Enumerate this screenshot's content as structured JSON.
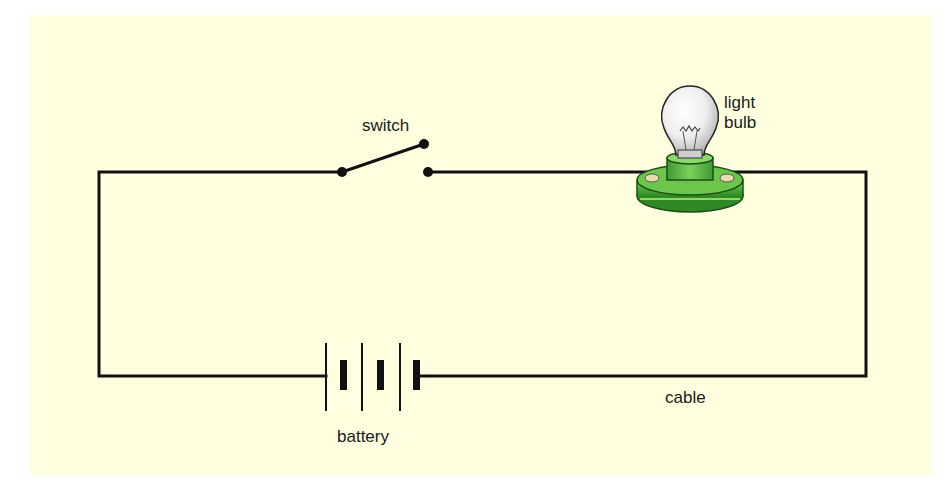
{
  "diagram": {
    "type": "simple electric circuit",
    "background_color": "#ffffe0",
    "wire_color": "#111111",
    "labels": {
      "switch": "switch",
      "light_bulb_line1": "light",
      "light_bulb_line2": "bulb",
      "battery": "battery",
      "cable": "cable"
    },
    "components": [
      {
        "name": "switch",
        "state": "open"
      },
      {
        "name": "light bulb",
        "holder_color": "#4cae3c"
      },
      {
        "name": "battery",
        "cells": 3
      },
      {
        "name": "cable"
      }
    ]
  }
}
